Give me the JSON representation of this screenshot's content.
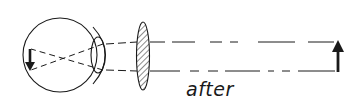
{
  "diagram": {
    "caption": "after",
    "colors": {
      "stroke": "#1a1a1a",
      "background": "#ffffff",
      "lens_hatch": "#1a1a1a"
    },
    "elements": [
      {
        "name": "eyeball",
        "type": "circle"
      },
      {
        "name": "cornea",
        "type": "arc"
      },
      {
        "name": "crystalline-lens",
        "type": "ellipse"
      },
      {
        "name": "retinal-image",
        "type": "arrow",
        "direction": "down"
      },
      {
        "name": "corrective-lens",
        "type": "hatched-ellipse"
      },
      {
        "name": "light-rays",
        "type": "dashed-lines",
        "count": 2
      },
      {
        "name": "object",
        "type": "arrow",
        "direction": "up"
      }
    ]
  }
}
